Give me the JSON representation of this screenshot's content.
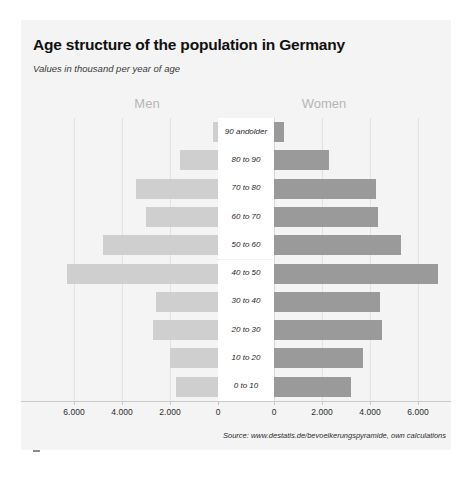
{
  "title": "Age structure of the population in Germany",
  "subtitle": "Values in thousand per year of age",
  "men_header": "Men",
  "women_header": "Women",
  "source": "Source: www.destatis.de/bevoelkerungspyramide, own calculations",
  "colors": {
    "men_bar": "#cfcfcf",
    "women_bar": "#9a9a9a",
    "panel_background": "#f4f4f4",
    "gridline": "#e2e2e2",
    "title_text": "#101010",
    "header_text": "#b6b6b6"
  },
  "axis": {
    "tick_labels": [
      "6.000",
      "4.000",
      "2.000",
      "0",
      "0",
      "2.000",
      "4.000",
      "6.000"
    ],
    "max_value": 7000
  },
  "chart_data": {
    "type": "bar",
    "title": "Age structure of the population in Germany",
    "subtitle": "Values in thousand per year of age",
    "xlabel": "",
    "ylabel": "",
    "orientation": "horizontal",
    "layout": "population-pyramid",
    "grid": true,
    "legend": "top-center-split",
    "categories": [
      "90 and older",
      "80 to 90",
      "70 to 80",
      "60 to 70",
      "50 to 60",
      "40 to 50",
      "30 to 40",
      "20 to 30",
      "10 to 20",
      "0 to 10"
    ],
    "series": [
      {
        "name": "Men",
        "side": "left",
        "color": "#cfcfcf",
        "values": [
          200,
          1600,
          3400,
          3000,
          4800,
          6300,
          2600,
          2700,
          2000,
          1750
        ]
      },
      {
        "name": "Women",
        "side": "right",
        "color": "#9a9a9a",
        "values": [
          400,
          2300,
          4250,
          4350,
          5300,
          6850,
          4400,
          4500,
          3700,
          3200
        ]
      }
    ],
    "xticks_left": [
      6000,
      4000,
      2000,
      0
    ],
    "xticks_right": [
      0,
      2000,
      4000,
      6000
    ],
    "xlim": [
      0,
      7000
    ],
    "units": "thousand persons per age band",
    "annotations": [
      "Source: www.destatis.de/bevoelkerungspyramide, own calculations"
    ]
  }
}
